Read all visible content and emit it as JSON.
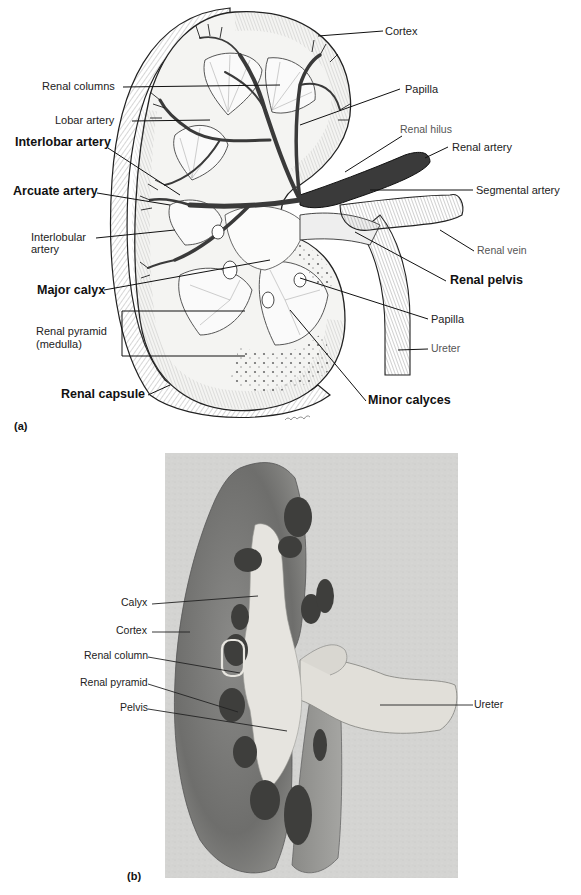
{
  "figure": {
    "panel_a": {
      "tag": "(a)",
      "type": "illustration",
      "subject": "Frontal section of kidney showing internal anatomy and blood vessels",
      "labels": {
        "renal_columns": "Renal columns",
        "lobar_artery": "Lobar artery",
        "interlobar_artery": "Interlobar artery",
        "arcuate_artery": "Arcuate artery",
        "interlobular_artery_line1": "Interlobular",
        "interlobular_artery_line2": "artery",
        "major_calyx": "Major calyx",
        "renal_pyramid_line1": "Renal pyramid",
        "renal_pyramid_line2": "(medulla)",
        "renal_capsule": "Renal capsule",
        "cortex": "Cortex",
        "papilla_top": "Papilla",
        "renal_hilus": "Renal hilus",
        "renal_artery": "Renal artery",
        "segmental_artery": "Segmental artery",
        "renal_vein": "Renal vein",
        "renal_pelvis": "Renal pelvis",
        "papilla_bottom": "Papilla",
        "ureter": "Ureter",
        "minor_calyces": "Minor calyces"
      }
    },
    "panel_b": {
      "tag": "(b)",
      "type": "photograph",
      "subject": "Photograph of sectioned kidney",
      "labels": {
        "calyx": "Calyx",
        "cortex": "Cortex",
        "renal_column": "Renal column",
        "renal_pyramid": "Renal pyramid",
        "pelvis": "Pelvis",
        "ureter": "Ureter"
      }
    },
    "colors": {
      "background": "#ffffff",
      "ink": "#1a1a1a",
      "vessel_dark": "#3a3a3a",
      "photo_bg": "#d4d4d2",
      "tissue_dark": "#6e6e6c",
      "tissue_pale": "#e6e4df"
    }
  }
}
